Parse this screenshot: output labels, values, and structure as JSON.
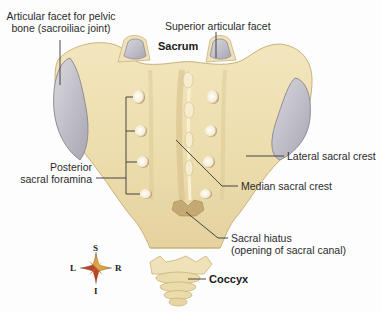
{
  "figure": {
    "colors": {
      "background": "#fdfdfd",
      "bone": "#eedfb0",
      "bone_shadow": "#d8c48e",
      "bone_highlight": "#f8efcf",
      "facet": "#c9c7cf",
      "facet_edge": "#9d9aa6",
      "leader_line": "#333333",
      "compass_red": "#b8452a",
      "compass_gold": "#d9a441"
    },
    "labels": {
      "articular_facet": [
        "Articular facet for pelvic",
        "bone (sacroiliac joint)"
      ],
      "superior_articular_facet": "Superior articular facet",
      "sacrum": "Sacrum",
      "posterior_sacral_foramina": [
        "Posterior",
        "sacral foramina"
      ],
      "lateral_sacral_crest": "Lateral sacral crest",
      "median_sacral_crest": "Median sacral crest",
      "sacral_hiatus": [
        "Sacral hiatus",
        "(opening of sacral canal)"
      ],
      "coccyx": "Coccyx"
    },
    "compass": {
      "superior": "S",
      "inferior": "I",
      "left": "L",
      "right": "R"
    }
  }
}
